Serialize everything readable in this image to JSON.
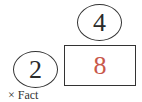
{
  "diagram": {
    "factor_top": "4",
    "factor_left": "2",
    "product": "8",
    "product_color": "#c8584a",
    "caption": "× Fact"
  }
}
